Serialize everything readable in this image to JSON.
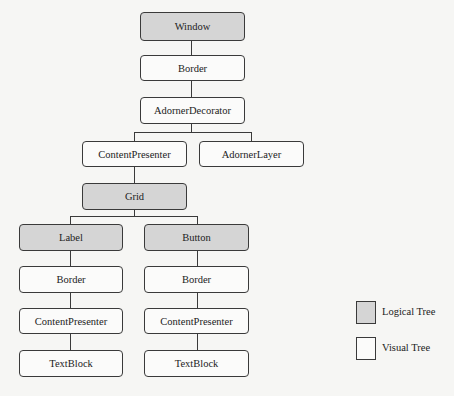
{
  "diagram": {
    "type": "tree",
    "nodes": {
      "window": {
        "label": "Window",
        "kind": "logical"
      },
      "border_top": {
        "label": "Border",
        "kind": "visual"
      },
      "adorner_decorator": {
        "label": "AdornerDecorator",
        "kind": "visual"
      },
      "content_presenter_top": {
        "label": "ContentPresenter",
        "kind": "visual"
      },
      "adorner_layer": {
        "label": "AdornerLayer",
        "kind": "visual"
      },
      "grid": {
        "label": "Grid",
        "kind": "logical"
      },
      "label": {
        "label": "Label",
        "kind": "logical"
      },
      "button": {
        "label": "Button",
        "kind": "logical"
      },
      "label_border": {
        "label": "Border",
        "kind": "visual"
      },
      "label_content_presenter": {
        "label": "ContentPresenter",
        "kind": "visual"
      },
      "label_textblock": {
        "label": "TextBlock",
        "kind": "visual"
      },
      "button_border": {
        "label": "Border",
        "kind": "visual"
      },
      "button_content_presenter": {
        "label": "ContentPresenter",
        "kind": "visual"
      },
      "button_textblock": {
        "label": "TextBlock",
        "kind": "visual"
      }
    },
    "edges": [
      [
        "window",
        "border_top"
      ],
      [
        "border_top",
        "adorner_decorator"
      ],
      [
        "adorner_decorator",
        "content_presenter_top"
      ],
      [
        "adorner_decorator",
        "adorner_layer"
      ],
      [
        "content_presenter_top",
        "grid"
      ],
      [
        "grid",
        "label"
      ],
      [
        "grid",
        "button"
      ],
      [
        "label",
        "label_border"
      ],
      [
        "label_border",
        "label_content_presenter"
      ],
      [
        "label_content_presenter",
        "label_textblock"
      ],
      [
        "button",
        "button_border"
      ],
      [
        "button_border",
        "button_content_presenter"
      ],
      [
        "button_content_presenter",
        "button_textblock"
      ]
    ]
  },
  "legend": {
    "logical": {
      "label": "Logical Tree",
      "color": "#d5d5d5"
    },
    "visual": {
      "label": "Visual Tree",
      "color": "#fbfbfa"
    }
  }
}
